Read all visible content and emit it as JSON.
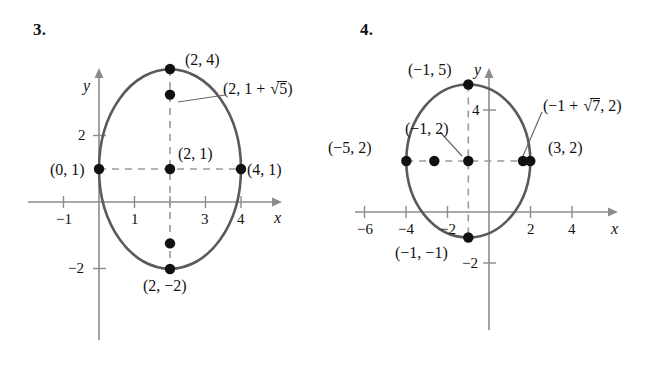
{
  "page": {
    "width": 668,
    "height": 368,
    "background": "#ffffff",
    "ink": "#111111",
    "curve_color": "#5a5a5a",
    "axis_color": "#8c8c8c",
    "dash_color": "#9a9a9a"
  },
  "figures": [
    {
      "number": "3.",
      "curve_type": "ellipse",
      "center": [
        2,
        1
      ],
      "semi_axis_x": 2,
      "semi_axis_y": 3,
      "axis_labels": {
        "x": "x",
        "y": "y"
      },
      "x_ticks": [
        {
          "value": -1,
          "label": "−1"
        },
        {
          "value": 1,
          "label": "1"
        },
        {
          "value": 2,
          "label": ""
        },
        {
          "value": 3,
          "label": "3"
        },
        {
          "value": 4,
          "label": "4"
        }
      ],
      "y_ticks": [
        {
          "value": 2,
          "label": "2"
        },
        {
          "value": -2,
          "label": "−2"
        }
      ],
      "points": [
        {
          "id": "top-vertex",
          "coords": [
            2,
            4
          ],
          "label": "(2, 4)"
        },
        {
          "id": "upper-focus",
          "coords": [
            2,
            3.236
          ],
          "label_prefix": "(2, 1 + ",
          "label_radicand": "5",
          "label_suffix": ")",
          "has_radical": true
        },
        {
          "id": "center",
          "coords": [
            2,
            1
          ],
          "label": "(2, 1)"
        },
        {
          "id": "left-vertex",
          "coords": [
            0,
            1
          ],
          "label": "(0, 1)"
        },
        {
          "id": "right-vertex",
          "coords": [
            4,
            1
          ],
          "label": "(4, 1)"
        },
        {
          "id": "lower-focus",
          "coords": [
            2,
            -1.236
          ],
          "label": ""
        },
        {
          "id": "bottom-vertex",
          "coords": [
            2,
            -2
          ],
          "label": "(2, −2)"
        }
      ]
    },
    {
      "number": "4.",
      "curve_type": "circle",
      "center": [
        -1,
        2
      ],
      "radius": 3,
      "axis_labels": {
        "x": "x",
        "y": "y"
      },
      "x_ticks": [
        {
          "value": -6,
          "label": "−6"
        },
        {
          "value": -4,
          "label": "−4"
        },
        {
          "value": -2,
          "label": "−2"
        },
        {
          "value": 2,
          "label": "2"
        },
        {
          "value": 4,
          "label": "4"
        }
      ],
      "y_ticks": [
        {
          "value": 4,
          "label": "4"
        },
        {
          "value": -2,
          "label": "−2"
        }
      ],
      "points": [
        {
          "id": "top-vertex",
          "coords": [
            -1,
            5
          ],
          "label": "(−1, 5)"
        },
        {
          "id": "left-vertex",
          "coords": [
            -5,
            2
          ],
          "label": "(−5, 2)"
        },
        {
          "id": "left-focus",
          "coords": [
            -3.646,
            2
          ],
          "label": ""
        },
        {
          "id": "center",
          "coords": [
            -1,
            2
          ],
          "label": "(−1, 2)"
        },
        {
          "id": "right-focus",
          "coords": [
            1.646,
            2
          ],
          "label_prefix": "(−1 + ",
          "label_radicand": "7",
          "label_suffix": ", 2)",
          "has_radical": true
        },
        {
          "id": "right-vertex",
          "coords": [
            3,
            2
          ],
          "label": "(3, 2)"
        },
        {
          "id": "bottom-vertex",
          "coords": [
            -1,
            -1
          ],
          "label": "(−1, −1)"
        }
      ]
    }
  ]
}
